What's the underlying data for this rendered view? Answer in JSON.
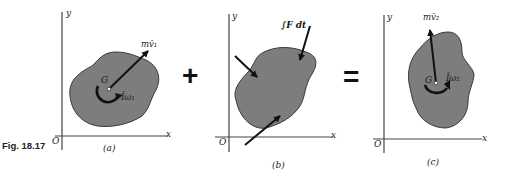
{
  "figure": {
    "label": "Fig. 18.17",
    "topic": "Impulse-momentum principle for a rigid body in plane motion"
  },
  "colors": {
    "background": "#ffffff",
    "body_fill": "#7d7d7d",
    "outline": "#3a3a3a",
    "ink": "#111111",
    "axis": "#444444"
  },
  "operators": {
    "plus": "+",
    "equals": "="
  },
  "panels": [
    {
      "id": "a",
      "caption": "(a)",
      "axis_x": "x",
      "axis_y": "y",
      "origin": "O",
      "center_label": "G",
      "vector_label": "mv̄₁",
      "moment_label": "Īω₁",
      "description": "Initial momenta: linear momentum m v-bar 1 at G and angular momentum I-bar omega 1"
    },
    {
      "id": "b",
      "caption": "(b)",
      "axis_x": "x",
      "axis_y": "y",
      "origin": "O",
      "impulse_label": "∫F dt",
      "description": "External impulses acting on the body"
    },
    {
      "id": "c",
      "caption": "(c)",
      "axis_x": "x",
      "axis_y": "y",
      "origin": "O",
      "center_label": "G",
      "vector_label": "mv̄₂",
      "moment_label": "Īω₂",
      "description": "Final momenta: linear momentum m v-bar 2 at G and angular momentum I-bar omega 2"
    }
  ]
}
